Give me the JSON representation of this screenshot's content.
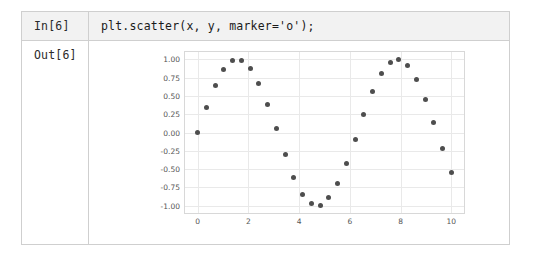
{
  "notebook": {
    "input": {
      "prompt_label": "In[6]",
      "code": "plt.scatter(x, y, marker='o');"
    },
    "output": {
      "prompt_label": "Out[6]"
    }
  },
  "chart_data": {
    "type": "scatter",
    "title": "",
    "xlabel": "",
    "ylabel": "",
    "marker": "o",
    "marker_color": "#4e4e4e",
    "grid": true,
    "legend": false,
    "xlim": [
      -0.5,
      10.5
    ],
    "ylim": [
      -1.1,
      1.1
    ],
    "xticks": [
      0,
      2,
      4,
      6,
      8,
      10
    ],
    "xtick_labels": [
      "0",
      "2",
      "4",
      "6",
      "8",
      "10"
    ],
    "yticks": [
      -1.0,
      -0.75,
      -0.5,
      -0.25,
      0.0,
      0.25,
      0.5,
      0.75,
      1.0
    ],
    "ytick_labels": [
      "-1.00",
      "-0.75",
      "-0.50",
      "-0.25",
      "0.00",
      "0.25",
      "0.50",
      "0.75",
      "1.00"
    ],
    "x": [
      0.0,
      0.345,
      0.69,
      1.034,
      1.379,
      1.724,
      2.069,
      2.414,
      2.759,
      3.103,
      3.448,
      3.793,
      4.138,
      4.483,
      4.828,
      5.172,
      5.517,
      5.862,
      6.207,
      6.552,
      6.897,
      7.241,
      7.586,
      7.931,
      8.276,
      8.621,
      8.966,
      9.31,
      9.655,
      10.0
    ],
    "y": [
      0.0,
      0.338,
      0.637,
      0.859,
      0.981,
      0.988,
      0.878,
      0.667,
      0.381,
      0.059,
      -0.302,
      -0.614,
      -0.841,
      -0.974,
      -0.993,
      -0.894,
      -0.698,
      -0.421,
      -0.1,
      0.249,
      0.565,
      0.811,
      0.962,
      0.998,
      0.915,
      0.726,
      0.452,
      0.13,
      -0.22,
      -0.544
    ]
  }
}
